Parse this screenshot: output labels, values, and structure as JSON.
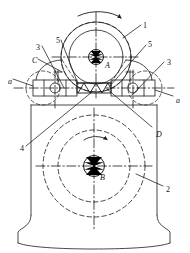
{
  "figure": {
    "type": "mechanical-assembly-cross-section",
    "title": ""
  },
  "callouts": [
    {
      "id": "1",
      "text": "1",
      "x": 143,
      "y": 22,
      "role": "upper-roller"
    },
    {
      "id": "2",
      "text": "2",
      "x": 166,
      "y": 186,
      "role": "lower-roller"
    },
    {
      "id": "3L",
      "text": "3",
      "x": 36,
      "y": 44,
      "role": "bearing-housing-left"
    },
    {
      "id": "3R",
      "text": "3",
      "x": 167,
      "y": 59,
      "role": "bearing-housing-right"
    },
    {
      "id": "4",
      "text": "4",
      "x": 20,
      "y": 145,
      "role": "wedge-linkage"
    },
    {
      "id": "5L",
      "text": "5",
      "x": 56,
      "y": 37,
      "role": "tie-rod-left"
    },
    {
      "id": "5R",
      "text": "5",
      "x": 148,
      "y": 41,
      "role": "tie-rod-right"
    }
  ],
  "points": [
    {
      "id": "A",
      "text": "A",
      "x": 105,
      "y": 62,
      "role": "upper-roller-center"
    },
    {
      "id": "B",
      "text": "B",
      "x": 100,
      "y": 174,
      "role": "lower-roller-center"
    },
    {
      "id": "C",
      "text": "C",
      "x": 32,
      "y": 57,
      "role": "left-contact-point"
    },
    {
      "id": "D",
      "text": "D",
      "x": 156,
      "y": 131,
      "role": "right-contact-point"
    }
  ],
  "section_marks": [
    {
      "id": "a-left",
      "text": "a",
      "x": 8,
      "y": 78,
      "role": "section-line-left"
    },
    {
      "id": "a-right",
      "text": "a",
      "x": 176,
      "y": 97,
      "role": "section-line-right"
    }
  ],
  "rotation_arrows": [
    {
      "id": "arrow-top",
      "label": "clockwise rotation of upper roller"
    },
    {
      "id": "arrow-middle",
      "label": "clockwise rotation of lower roller"
    }
  ],
  "colors": {
    "line": "#1a1a1a",
    "background": "#ffffff",
    "hub_fill": "#000000"
  }
}
